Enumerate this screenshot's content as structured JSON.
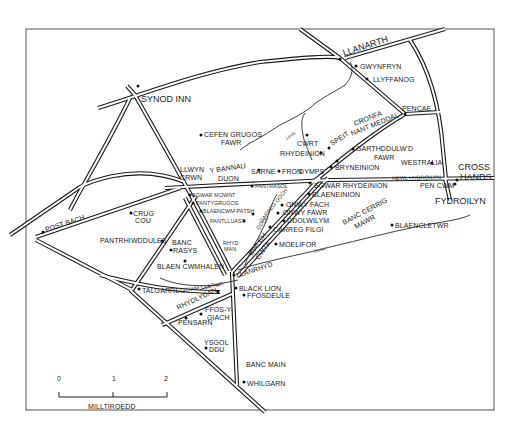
{
  "map": {
    "towns": {
      "llanarth": "LLANARTH",
      "synod_inn": "SYNOD INN",
      "cross_hands_1": "CROSS",
      "cross_hands_2": "HANDS",
      "fydroilyn": "FYDROILYN",
      "post_bach": "POST BACH",
      "talgarreg": "TALGARREG"
    },
    "places": {
      "gwynfryn": "GWYNFRYN",
      "llyffanog": "LLYFFANOG",
      "pencae": "PENCAE",
      "cronfa_1": "CRONFA",
      "cronfa_2": "NANT MEDDAL",
      "speit": "SPEIT",
      "garthddulwd_1": "GARTHDDULW'D",
      "garthddulwd_2": "FAWR",
      "westralia": "WESTRALIA",
      "cefen_grugos_1": "CEFEN GRUGOS",
      "cefen_grugos_2": "FAWR",
      "cwrt": "CWRT",
      "rhydeinion": "RHYDEINION",
      "bryneinion": "BRYNEINION",
      "dymps": "DYMPS",
      "fron": "FRON",
      "sarne": "SARNE",
      "y_bannau_1": "Y BANNAU",
      "y_bannau_2": "DUON",
      "llwyn_crwn_1": "LLWYN",
      "llwyn_crwn_2": "CRWN",
      "sgwar_rhydeinion": "SGWAR RHYDEINION",
      "pen_cwm": "PEN CWM",
      "pantrasol": "PANTRASOL",
      "sgwar_mownt": "SGWAR MOWNT",
      "pantygrugos": "PANTYGRUGOS",
      "blaencwm_patsh": "BLAENCWM-PATSH",
      "pantlluast": "PANTLLUAST",
      "blaeneinion": "BLAENEINION",
      "onwy_fach": "ONWY FACH",
      "onwy_fawr": "ONWY FAWR",
      "ddolwilym": "DDOLWILYM",
      "carreg_filgi": "CARREG FILGI",
      "banc_cerrig_1": "BANC CERRIG",
      "banc_cerrig_2": "MAWR",
      "blaencletwr": "BLAENCLETWR",
      "moelifor": "MOELIFOR",
      "crug_cou_1": "CRUG",
      "crug_cou_2": "COU",
      "pantrhiwddules": "PANTRHIWDDULES",
      "banc_rasys_1": "BANC",
      "banc_rasys_2": "RASYS",
      "blaen_cwmhalen": "BLAEN CWMHALEN",
      "rhyd_man_1": "RHYD",
      "rhyd_man_2": "MAN",
      "bwlch_cwta_1": "BWLCH",
      "bwlch_cwta_2": "CWTA",
      "llanrhyd": "LLANRHYD",
      "black_lion": "BLACK LION",
      "ffosdeule": "FFOSDEULE",
      "cwm_cletwr": "CWM CLETWR",
      "rhydlydan": "RHYDLYDAN",
      "ffos_y_giach_1": "FFOS-Y-",
      "ffos_y_giach_2": "GIACH",
      "pensarn": "PENSARN",
      "ysgol_ddu_1": "YSGOL",
      "ysgol_ddu_2": "DDU",
      "banc_main": "BANC MAIN",
      "whilgarn": "WHILGARN"
    },
    "roads": {
      "hewl_hydroilyn": "HEWL HYDROILYN",
      "carreg_goch": "CARREG GOCH",
      "ddol": "DDOL"
    },
    "rivers": {
      "llethi": "Llethi",
      "cletwr": "Cletwr"
    },
    "scale_bar": {
      "ticks": [
        "0",
        "1",
        "2"
      ],
      "label": "MILLTIROEDD"
    }
  }
}
